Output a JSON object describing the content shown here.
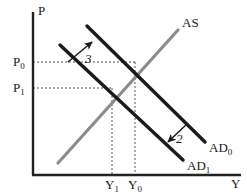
{
  "figure": {
    "kind": "economics-ad-as-diagram",
    "width": 247,
    "height": 195,
    "background": "#ffffff"
  },
  "axes": {
    "y_label": "P",
    "x_label": "Y",
    "color": "#222222",
    "origin": {
      "x": 32,
      "y": 175
    },
    "x_end": 241,
    "y_top": 12
  },
  "ticks": {
    "y": [
      {
        "label_main": "P",
        "label_sub": "0",
        "value": 62
      },
      {
        "label_main": "P",
        "label_sub": "1",
        "value": 88
      }
    ],
    "x": [
      {
        "label_main": "Y",
        "label_sub": "1",
        "value": 112
      },
      {
        "label_main": "Y",
        "label_sub": "0",
        "value": 135
      }
    ]
  },
  "curves": [
    {
      "name": "AS",
      "label_main": "AS",
      "label_sub": "",
      "color": "#8c8c8c",
      "width": 3.2,
      "x1": 58,
      "y1": 163,
      "x2": 178,
      "y2": 30,
      "label_x": 182,
      "label_y": 16
    },
    {
      "name": "AD0",
      "label_main": "AD",
      "label_sub": "0",
      "color": "#1a1a1a",
      "width": 3.4,
      "x1": 87,
      "y1": 26,
      "x2": 205,
      "y2": 142,
      "label_x": 209,
      "label_y": 141
    },
    {
      "name": "AD1",
      "label_main": "AD",
      "label_sub": "1",
      "color": "#1a1a1a",
      "width": 3.4,
      "x1": 60,
      "y1": 45,
      "x2": 183,
      "y2": 160,
      "label_x": 187,
      "label_y": 159
    }
  ],
  "equilibria": [
    {
      "name": "E0",
      "x": 135,
      "y": 62
    },
    {
      "name": "E1",
      "x": 112,
      "y": 88
    }
  ],
  "guides": {
    "color": "#555555",
    "dash": "2,2",
    "lines": [
      {
        "name": "p0-horizontal",
        "x1": 33,
        "y1": 62,
        "x2": 135,
        "y2": 62
      },
      {
        "name": "p1-horizontal",
        "x1": 33,
        "y1": 88,
        "x2": 112,
        "y2": 88
      },
      {
        "name": "y0-vertical",
        "x1": 135,
        "y1": 62,
        "x2": 135,
        "y2": 174
      },
      {
        "name": "y1-vertical",
        "x1": 112,
        "y1": 88,
        "x2": 112,
        "y2": 174
      }
    ]
  },
  "annotations": [
    {
      "name": "shift-3",
      "label": "3",
      "color": "#1a1a1a",
      "arrow": {
        "x1": 68,
        "y1": 62,
        "x2": 92,
        "y2": 42
      },
      "label_x": 85,
      "label_y": 52
    },
    {
      "name": "shift-2",
      "label": "2",
      "color": "#1a1a1a",
      "arrow": {
        "x1": 188,
        "y1": 123,
        "x2": 168,
        "y2": 142
      },
      "label_x": 176,
      "label_y": 132
    }
  ]
}
